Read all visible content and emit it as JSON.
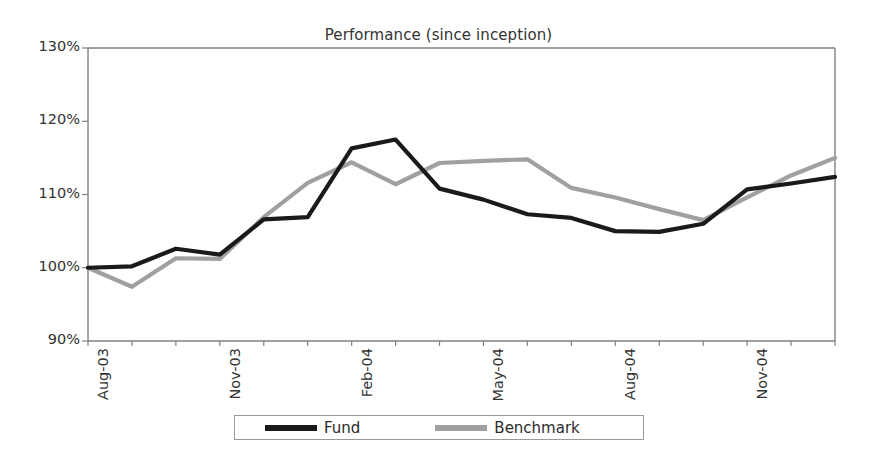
{
  "chart_data": {
    "type": "line",
    "title": "Performance (since inception)",
    "xlabel": "",
    "ylabel": "",
    "ylim": [
      90,
      130
    ],
    "ytick_labels": [
      "130%",
      "120%",
      "110%",
      "100%",
      "90%"
    ],
    "ytick_values": [
      130,
      120,
      110,
      100,
      90
    ],
    "grid": false,
    "legend_position": "bottom",
    "x": [
      "Aug-03",
      "Sep-03",
      "Oct-03",
      "Nov-03",
      "Dec-03",
      "Jan-04",
      "Feb-04",
      "Mar-04",
      "Apr-04",
      "May-04",
      "Jun-04",
      "Jul-04",
      "Aug-04",
      "Sep-04",
      "Oct-04",
      "Nov-04",
      "Dec-04",
      "Jan-05"
    ],
    "xtick_labels": [
      "Aug-03",
      "",
      "",
      "Nov-03",
      "",
      "",
      "Feb-04",
      "",
      "",
      "May-04",
      "",
      "",
      "Aug-04",
      "",
      "",
      "Nov-04",
      "",
      ""
    ],
    "series": [
      {
        "name": "Fund",
        "color": "#1a1a1a",
        "values": [
          100.0,
          100.2,
          102.6,
          101.8,
          106.6,
          106.9,
          116.3,
          117.5,
          110.8,
          109.3,
          107.3,
          106.8,
          105.0,
          104.9,
          106.0,
          110.7,
          111.5,
          112.4
        ]
      },
      {
        "name": "Benchmark",
        "color": "#a0a0a0",
        "values": [
          100.0,
          97.4,
          101.3,
          101.2,
          106.9,
          111.6,
          114.4,
          111.4,
          114.3,
          114.6,
          114.8,
          110.9,
          109.6,
          108.0,
          106.5,
          109.6,
          112.6,
          115.0
        ]
      }
    ]
  },
  "legend": {
    "items": [
      {
        "label": "Fund",
        "color": "#1a1a1a"
      },
      {
        "label": "Benchmark",
        "color": "#a0a0a0"
      }
    ]
  },
  "axes": {
    "frame_color": "#808080",
    "tick_color": "#808080"
  }
}
